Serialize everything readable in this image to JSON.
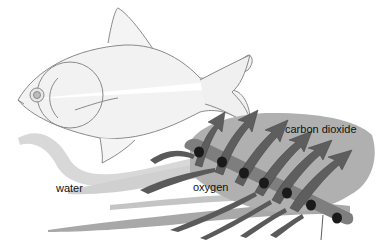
{
  "diagram": {
    "labels": {
      "carbon_dioxide": "carbon dioxide",
      "oxygen": "oxygen",
      "water": "water"
    },
    "colors": {
      "background": "#ffffff",
      "fish_outline": "#8a8a8a",
      "water_light": "#d6d6d6",
      "water_mid": "#b5b5b5",
      "water_dark": "#8e8e8e",
      "gill_plate": "#a9a9a9",
      "gill_filament": "#7c7c7c",
      "arrow": "#5e5e5e",
      "blood_cell": "#1a1a1a"
    },
    "blood_cell_count": 7,
    "arrow_count": 7
  }
}
